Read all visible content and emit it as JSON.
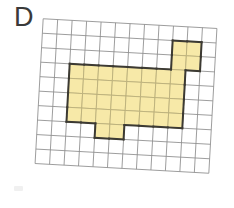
{
  "figure": {
    "panel_label": "D",
    "grid": {
      "columns": 12,
      "rows": 10,
      "cell_size_px": 14.5,
      "rotation_degrees": 3.2,
      "line_color": "#8e8e8e"
    },
    "shape": {
      "fill_color": "#f7e9a8",
      "cell_border_color": "#b8ad79",
      "outline_color": "#3c3a33",
      "total_cells": 42,
      "parts": [
        {
          "name": "top-right-tab",
          "col_start": 9,
          "row_start": 1,
          "width": 2,
          "height": 2,
          "cells": 4
        },
        {
          "name": "main-body",
          "col_start": 2,
          "row_start": 3,
          "width": 8,
          "height": 4,
          "cells": 32
        },
        {
          "name": "bottom-tab",
          "col_start": 4,
          "row_start": 7,
          "width": 2,
          "height": 1,
          "cells": 2
        }
      ]
    }
  }
}
